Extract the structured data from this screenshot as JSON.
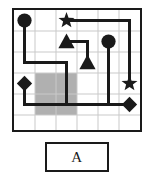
{
  "puzzle": {
    "label": "A",
    "colors": {
      "ink": "#1a1a1a",
      "gridline": "#c9c9c9",
      "shaded_cell": "#b0b0b0",
      "background": "#ffffff"
    },
    "board": {
      "columns": 6,
      "rows": 6,
      "cell_size": 21,
      "grid_visible": true,
      "border_width": 2
    },
    "shaded_regions": [
      {
        "name": "gray-block",
        "col": 1,
        "row": 3,
        "width_cells": 2,
        "height_cells": 2,
        "color": "#b0b0b0"
      }
    ],
    "nodes": [
      {
        "name": "circle-top-left",
        "shape": "circle",
        "col": 0,
        "row": 0,
        "size": 15
      },
      {
        "name": "star-top",
        "shape": "star",
        "col": 2,
        "row": 0,
        "size": 15
      },
      {
        "name": "triangle-upper",
        "shape": "triangle",
        "col": 2,
        "row": 1,
        "size": 15
      },
      {
        "name": "circle-right",
        "shape": "circle",
        "col": 4,
        "row": 1,
        "size": 15
      },
      {
        "name": "triangle-lower",
        "shape": "triangle",
        "col": 3,
        "row": 2,
        "size": 15
      },
      {
        "name": "diamond-left",
        "shape": "diamond",
        "col": 0,
        "row": 3,
        "size": 15
      },
      {
        "name": "star-right",
        "shape": "star",
        "col": 5,
        "row": 3,
        "size": 15
      },
      {
        "name": "diamond-bottom-right",
        "shape": "diamond",
        "col": 5,
        "row": 4,
        "size": 15
      }
    ],
    "paths": [
      {
        "name": "path-circle-to-gray",
        "stroke_width": 3,
        "points": [
          [
            0,
            0
          ],
          [
            0,
            2
          ],
          [
            2,
            2
          ],
          [
            2,
            4
          ],
          [
            4,
            4
          ],
          [
            4,
            1
          ]
        ]
      },
      {
        "name": "path-star-top-to-star-right",
        "stroke_width": 3,
        "points": [
          [
            2,
            0
          ],
          [
            5,
            0
          ],
          [
            5,
            3
          ]
        ]
      },
      {
        "name": "path-triangle-to-triangle",
        "stroke_width": 3,
        "points": [
          [
            2,
            1
          ],
          [
            3,
            1
          ],
          [
            3,
            2
          ]
        ]
      },
      {
        "name": "path-diamond-to-diamond",
        "stroke_width": 3,
        "points": [
          [
            0,
            3
          ],
          [
            0,
            4
          ],
          [
            5,
            4
          ]
        ]
      }
    ]
  }
}
